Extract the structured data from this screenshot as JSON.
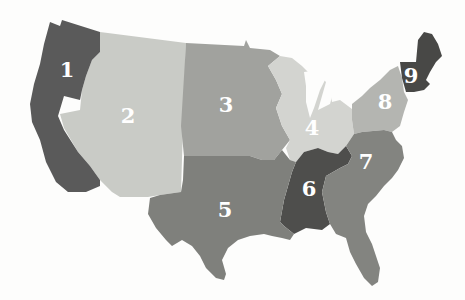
{
  "map": {
    "title": "",
    "subject": "United States divided into 9 numbered regions",
    "background_color": "#fdfdfc",
    "label_color": "#ffffff",
    "regions": [
      {
        "id": "1",
        "label": "1",
        "name": "Pacific (WA, OR, CA)",
        "color": "#5a5a5a"
      },
      {
        "id": "2",
        "label": "2",
        "name": "Mountain (ID, MT, WY, NV, UT, CO, AZ, NM)",
        "color": "#c9cbc6"
      },
      {
        "id": "3",
        "label": "3",
        "name": "West North Central (ND, SD, NE, KS, MN, IA, MO)",
        "color": "#a1a29e"
      },
      {
        "id": "4",
        "label": "4",
        "name": "East North Central (WI, MI, IL, IN, OH)",
        "color": "#d3d4d0"
      },
      {
        "id": "5",
        "label": "5",
        "name": "West South Central (OK, TX, AR, LA)",
        "color": "#7f807c"
      },
      {
        "id": "6",
        "label": "6",
        "name": "East South Central (KY, TN, MS, AL)",
        "color": "#4e4e4c"
      },
      {
        "id": "7",
        "label": "7",
        "name": "South Atlantic (WV, VA, MD, DE, NC, SC, GA, FL)",
        "color": "#838480"
      },
      {
        "id": "8",
        "label": "8",
        "name": "Middle Atlantic (NY, PA, NJ)",
        "color": "#b4b5b1"
      },
      {
        "id": "9",
        "label": "9",
        "name": "New England (ME, NH, VT, MA, CT, RI)",
        "color": "#484846"
      }
    ]
  }
}
